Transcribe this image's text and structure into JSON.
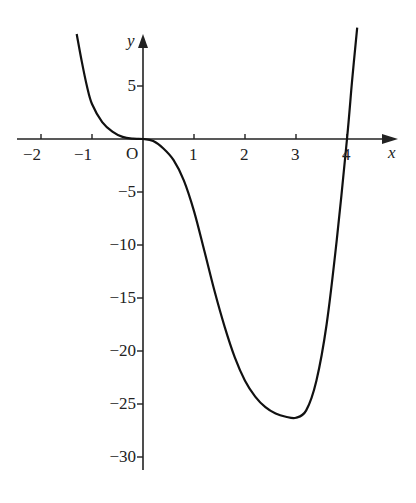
{
  "chart_data": {
    "type": "line",
    "title": "",
    "xlabel": "x",
    "ylabel": "y",
    "origin_label": "O",
    "xlim": [
      -2.4,
      5
    ],
    "ylim": [
      -31.5,
      10.5
    ],
    "grid": false,
    "legend": null,
    "x_ticks": [
      -2,
      -1,
      1,
      2,
      3,
      4
    ],
    "x_tick_labels": [
      "−2",
      "−1",
      "1",
      "2",
      "3",
      "4"
    ],
    "y_ticks": [
      5,
      -5,
      -10,
      -15,
      -20,
      -25,
      -30
    ],
    "y_tick_labels": [
      "5",
      "−5",
      "−10",
      "−15",
      "−20",
      "−25",
      "−30"
    ],
    "series": [
      {
        "name": "curve",
        "x": [
          -1.3,
          -1.2,
          -1.1,
          -1.0,
          -0.8,
          -0.6,
          -0.4,
          -0.2,
          0,
          0.2,
          0.4,
          0.6,
          0.8,
          1.0,
          1.2,
          1.4,
          1.6,
          1.8,
          2.0,
          2.2,
          2.4,
          2.6,
          2.8,
          3.0,
          3.2,
          3.4,
          3.6,
          3.8,
          4.0,
          4.1,
          4.2
        ],
        "y": [
          9.9,
          7.3,
          5.0,
          3.3,
          1.6,
          0.7,
          0.2,
          0.03,
          0,
          -0.2,
          -0.9,
          -2.0,
          -3.9,
          -6.8,
          -10.5,
          -14.3,
          -17.7,
          -20.6,
          -22.8,
          -24.3,
          -25.3,
          -25.9,
          -26.2,
          -26.3,
          -25.6,
          -22.8,
          -17.5,
          -9.5,
          0,
          5.5,
          10.5
        ]
      }
    ]
  }
}
